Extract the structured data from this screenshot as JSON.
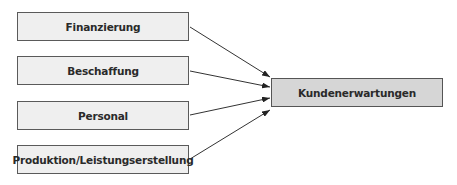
{
  "diagram": {
    "type": "flow",
    "sources": [
      {
        "label": "Finanzierung"
      },
      {
        "label": "Beschaffung"
      },
      {
        "label": "Personal"
      },
      {
        "label": "Produktion/Leistungserstellung"
      }
    ],
    "target": {
      "label": "Kundenerwartungen"
    },
    "edges": [
      {
        "from": "Finanzierung",
        "to": "Kundenerwartungen"
      },
      {
        "from": "Beschaffung",
        "to": "Kundenerwartungen"
      },
      {
        "from": "Personal",
        "to": "Kundenerwartungen"
      },
      {
        "from": "Produktion/Leistungserstellung",
        "to": "Kundenerwartungen"
      }
    ],
    "colors": {
      "source_fill": "#efefef",
      "target_fill": "#d6d6d6",
      "border": "#5a5a5a",
      "arrow": "#333333"
    }
  }
}
